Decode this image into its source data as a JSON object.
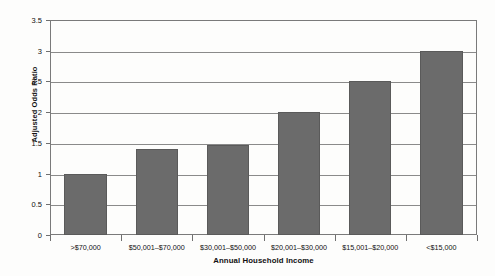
{
  "chart_data": {
    "type": "bar",
    "title": "",
    "xlabel": "Annual Household Income",
    "ylabel": "Adjusted Odds Ratio",
    "categories": [
      ">$70,000",
      "$50,001–$70,000",
      "$30,001–$50,000",
      "$20,001–$30,000",
      "$15,001–$20,000",
      "<$15,000"
    ],
    "values": [
      1.0,
      1.4,
      1.47,
      2.0,
      2.5,
      3.0
    ],
    "ylim": [
      0,
      3.5
    ],
    "yticks": [
      0,
      0.5,
      1,
      1.5,
      2,
      2.5,
      3,
      3.5
    ],
    "ytick_labels": [
      "0",
      "0.5",
      "1",
      "1.5",
      "2",
      "2.5",
      "3",
      "3.5"
    ],
    "grid": true,
    "legend": false,
    "bar_color": "#6b6b6b",
    "grid_color": "#8a8a8a",
    "axis_color": "#7a7a7a",
    "background_color": "#fdfdfc"
  }
}
